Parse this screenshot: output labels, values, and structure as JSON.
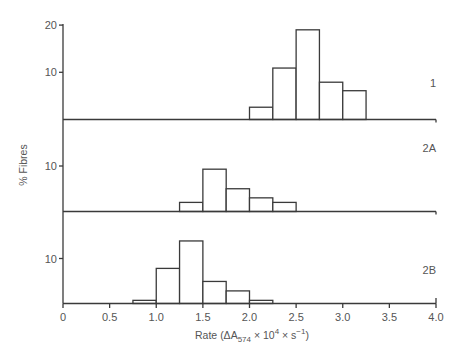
{
  "chart_data": {
    "type": "bar",
    "subtype": "stacked-panel-histogram",
    "title": "",
    "xlabel": "Rate (ΔA574 × 10^4 × s^-1)",
    "ylabel": "% Fibres",
    "xlim": [
      0,
      4.0
    ],
    "x_ticks": [
      "0",
      "0.5",
      "1.0",
      "1.5",
      "2.0",
      "2.5",
      "3.0",
      "3.5",
      "4.0"
    ],
    "bin_width": 0.25,
    "grid": false,
    "panels": [
      {
        "name": "1",
        "y_ticks": [
          "10",
          "20"
        ],
        "bins": [
          {
            "x0": 2.0,
            "x1": 2.25,
            "value": 2.6
          },
          {
            "x0": 2.25,
            "x1": 2.5,
            "value": 10.9
          },
          {
            "x0": 2.5,
            "x1": 2.75,
            "value": 19.0
          },
          {
            "x0": 2.75,
            "x1": 3.0,
            "value": 7.9
          },
          {
            "x0": 3.0,
            "x1": 3.25,
            "value": 6.1
          }
        ]
      },
      {
        "name": "2A",
        "y_ticks": [
          "10"
        ],
        "bins": [
          {
            "x0": 1.25,
            "x1": 1.5,
            "value": 2.0
          },
          {
            "x0": 1.5,
            "x1": 1.75,
            "value": 9.3
          },
          {
            "x0": 1.75,
            "x1": 2.0,
            "value": 5.0
          },
          {
            "x0": 2.0,
            "x1": 2.25,
            "value": 3.0
          },
          {
            "x0": 2.25,
            "x1": 2.5,
            "value": 2.0
          }
        ]
      },
      {
        "name": "2B",
        "y_ticks": [
          "10"
        ],
        "bins": [
          {
            "x0": 0.75,
            "x1": 1.0,
            "value": 0.7
          },
          {
            "x0": 1.0,
            "x1": 1.25,
            "value": 7.8
          },
          {
            "x0": 1.25,
            "x1": 1.5,
            "value": 13.9
          },
          {
            "x0": 1.5,
            "x1": 1.75,
            "value": 4.9
          },
          {
            "x0": 1.75,
            "x1": 2.0,
            "value": 2.8
          },
          {
            "x0": 2.0,
            "x1": 2.25,
            "value": 0.7
          }
        ]
      }
    ]
  },
  "labels": {
    "ylabel": "% Fibres",
    "xlabel_prefix": "Rate (ΔA",
    "xlabel_sub": "574",
    "xlabel_mid": " × 10",
    "xlabel_sup": "4",
    "xlabel_mid2": " × s",
    "xlabel_sup2": "−1",
    "xlabel_suffix": ")"
  },
  "colors": {
    "line": "#3a3a3a",
    "text": "#555555",
    "bar_fill": "#ffffff"
  }
}
